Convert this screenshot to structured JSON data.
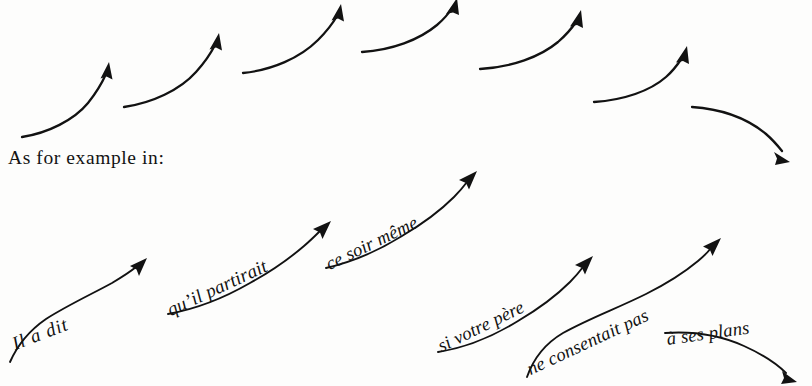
{
  "figure": {
    "caption": "As for example in:",
    "background_color": "#fdfdfc",
    "ink_color": "#121212"
  },
  "contour_row": {
    "name": "abstract-intonation-contours",
    "count": 7,
    "arrows": [
      {
        "id": "contour-1",
        "direction": "rising",
        "label": ""
      },
      {
        "id": "contour-2",
        "direction": "rising",
        "label": ""
      },
      {
        "id": "contour-3",
        "direction": "rising",
        "label": ""
      },
      {
        "id": "contour-4",
        "direction": "rising",
        "label": ""
      },
      {
        "id": "contour-5",
        "direction": "rising",
        "label": ""
      },
      {
        "id": "contour-6",
        "direction": "rising",
        "label": ""
      },
      {
        "id": "contour-7",
        "direction": "falling",
        "label": ""
      }
    ]
  },
  "example": {
    "language": "French",
    "sentence": "Il a dit qu'il partirait ce soir même si votre père ne consentait pas à ses plans",
    "phrases": [
      {
        "id": "phrase-1",
        "text": "Il  a  dit",
        "direction": "rising"
      },
      {
        "id": "phrase-2",
        "text": "qu’il partirait",
        "direction": "rising"
      },
      {
        "id": "phrase-3",
        "text": "ce soir même",
        "direction": "rising"
      },
      {
        "id": "phrase-4",
        "text": "si votre père",
        "direction": "rising"
      },
      {
        "id": "phrase-5",
        "text": "ne consentait pas",
        "direction": "rising"
      },
      {
        "id": "phrase-6",
        "text": "à ses plans",
        "direction": "falling"
      }
    ]
  }
}
